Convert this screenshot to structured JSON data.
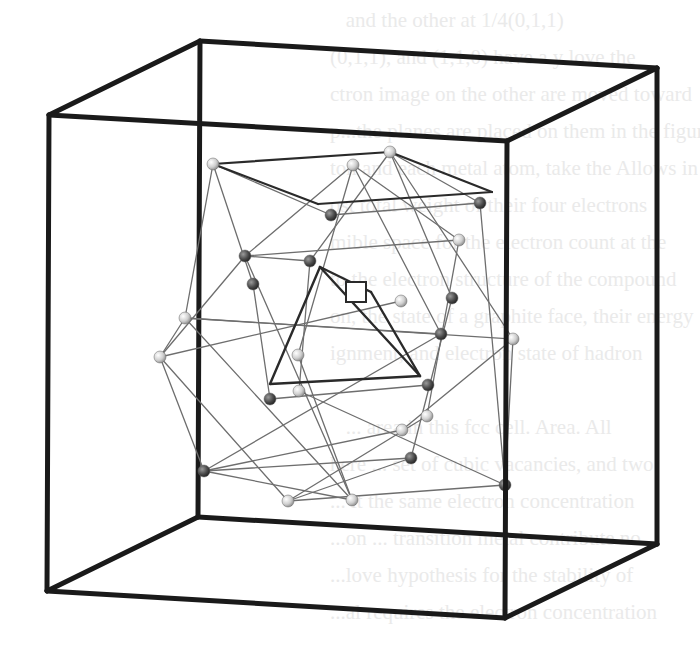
{
  "figure": {
    "colors": {
      "cube_edge": "#1a1a1a",
      "wire": "#6e6e6e",
      "inner_edge": "#2a2a2a",
      "sphere_light": "#d8d8d8",
      "sphere_dark": "#4a4a4a"
    },
    "cube": {
      "back": [
        [
          200,
          41
        ],
        [
          657,
          68
        ],
        [
          657,
          544
        ],
        [
          198,
          517
        ]
      ],
      "front": [
        [
          49,
          115
        ],
        [
          507,
          141
        ],
        [
          505,
          618
        ],
        [
          47,
          591
        ]
      ]
    },
    "top_square": [
      [
        213,
        164
      ],
      [
        390,
        152
      ],
      [
        492,
        192
      ],
      [
        318,
        204
      ]
    ],
    "tetrahedron": {
      "apex": [
        320,
        267
      ],
      "left": [
        270,
        384
      ],
      "right": [
        420,
        376
      ],
      "marker": [
        371,
        292
      ]
    },
    "marker_square": {
      "x": 346,
      "y": 282,
      "w": 20,
      "h": 20
    },
    "spheres": [
      {
        "p": [
          213,
          164
        ],
        "t": "l"
      },
      {
        "p": [
          353,
          165
        ],
        "t": "l"
      },
      {
        "p": [
          390,
          152
        ],
        "t": "l"
      },
      {
        "p": [
          331,
          215
        ],
        "t": "d"
      },
      {
        "p": [
          480,
          203
        ],
        "t": "d"
      },
      {
        "p": [
          459,
          240
        ],
        "t": "l"
      },
      {
        "p": [
          245,
          256
        ],
        "t": "d"
      },
      {
        "p": [
          310,
          261
        ],
        "t": "d"
      },
      {
        "p": [
          253,
          284
        ],
        "t": "d"
      },
      {
        "p": [
          401,
          301
        ],
        "t": "l"
      },
      {
        "p": [
          452,
          298
        ],
        "t": "d"
      },
      {
        "p": [
          185,
          318
        ],
        "t": "l"
      },
      {
        "p": [
          160,
          357
        ],
        "t": "l"
      },
      {
        "p": [
          513,
          339
        ],
        "t": "l"
      },
      {
        "p": [
          441,
          334
        ],
        "t": "d"
      },
      {
        "p": [
          298,
          355
        ],
        "t": "l"
      },
      {
        "p": [
          299,
          391
        ],
        "t": "l"
      },
      {
        "p": [
          270,
          399
        ],
        "t": "d"
      },
      {
        "p": [
          428,
          385
        ],
        "t": "d"
      },
      {
        "p": [
          427,
          416
        ],
        "t": "l"
      },
      {
        "p": [
          411,
          458
        ],
        "t": "d"
      },
      {
        "p": [
          402,
          430
        ],
        "t": "l"
      },
      {
        "p": [
          204,
          471
        ],
        "t": "d"
      },
      {
        "p": [
          288,
          501
        ],
        "t": "l"
      },
      {
        "p": [
          352,
          500
        ],
        "t": "l"
      },
      {
        "p": [
          505,
          485
        ],
        "t": "d"
      }
    ],
    "wires": [
      [
        213,
        164,
        185,
        318
      ],
      [
        213,
        164,
        253,
        284
      ],
      [
        213,
        164,
        331,
        215
      ],
      [
        353,
        165,
        245,
        256
      ],
      [
        353,
        165,
        298,
        355
      ],
      [
        353,
        165,
        459,
        240
      ],
      [
        353,
        165,
        441,
        334
      ],
      [
        390,
        152,
        310,
        261
      ],
      [
        390,
        152,
        480,
        203
      ],
      [
        390,
        152,
        513,
        339
      ],
      [
        390,
        152,
        452,
        298
      ],
      [
        331,
        215,
        480,
        203
      ],
      [
        245,
        256,
        459,
        240
      ],
      [
        245,
        256,
        310,
        261
      ],
      [
        185,
        318,
        160,
        357
      ],
      [
        160,
        357,
        204,
        471
      ],
      [
        185,
        318,
        513,
        339
      ],
      [
        160,
        357,
        245,
        256
      ],
      [
        160,
        357,
        288,
        501
      ],
      [
        185,
        318,
        441,
        334
      ],
      [
        253,
        284,
        270,
        399
      ],
      [
        310,
        261,
        299,
        391
      ],
      [
        459,
        240,
        427,
        416
      ],
      [
        480,
        203,
        505,
        485
      ],
      [
        513,
        339,
        505,
        485
      ],
      [
        513,
        339,
        402,
        430
      ],
      [
        441,
        334,
        204,
        471
      ],
      [
        452,
        298,
        411,
        458
      ],
      [
        270,
        399,
        428,
        385
      ],
      [
        299,
        391,
        505,
        485
      ],
      [
        204,
        471,
        411,
        458
      ],
      [
        288,
        501,
        411,
        458
      ],
      [
        288,
        501,
        505,
        485
      ],
      [
        352,
        500,
        204,
        471
      ],
      [
        352,
        500,
        245,
        256
      ],
      [
        402,
        430,
        204,
        471
      ],
      [
        427,
        416,
        288,
        501
      ],
      [
        298,
        355,
        352,
        500
      ],
      [
        401,
        301,
        160,
        357
      ],
      [
        185,
        318,
        352,
        500
      ]
    ],
    "ghost_text": [
      "   and the other at 1/4(0,1,1)",
      "(0,1,1), and (1,1,0) have a y love the",
      "ctron image on the other are moved toward",
      "p...the planes are placed on them in the figure",
      "ton and each metal atom, take the Allows in",
      "ost total weight of their four electrons",
      "mible space for the electron count at the",
      "to the electron structure of the compound",
      "on, the state of a graphite face, their energy",
      "ignment, and electron state of hadron",
      "",
      "   ... area in this fcc cell. Area. All",
      "here ... set of cubic vacancies, and two",
      "... it the same electron concentration",
      "...on ... transition metal contribute no",
      "...love hypothesis for the stability of",
      "...al requires the electron concentration"
    ]
  }
}
